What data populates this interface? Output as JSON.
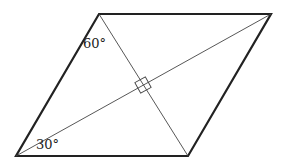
{
  "figure": {
    "shape": "parallelogram",
    "vertices": {
      "top_left": [
        99,
        14
      ],
      "top_right": [
        271,
        14
      ],
      "bottom_right": [
        188,
        156
      ],
      "bottom_left": [
        16,
        156
      ]
    },
    "diagonals": [
      {
        "from": "top_left",
        "to": "bottom_right"
      },
      {
        "from": "bottom_left",
        "to": "top_right"
      }
    ],
    "right_angle_marker_at": [
      143,
      85
    ],
    "labels": {
      "angle_top": "60°",
      "angle_bottom": "30°"
    },
    "colors": {
      "stroke": "#222222",
      "background": "#ffffff"
    }
  }
}
